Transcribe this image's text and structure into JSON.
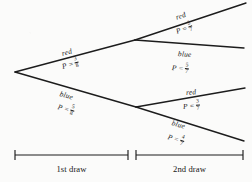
{
  "figure": {
    "type": "probability-tree",
    "background_color": "#fbfbfa",
    "ink_color": "#161616"
  },
  "nodes": {
    "root": {
      "x": 15,
      "y": 72
    },
    "upper": {
      "x": 135,
      "y": 40
    },
    "lower": {
      "x": 136,
      "y": 107
    }
  },
  "branches": [
    {
      "id": "first-red",
      "stage": 1,
      "outcome": "red",
      "probability_text": "P =",
      "numerator": "3",
      "denominator": "8",
      "from": "root",
      "to": "upper",
      "label_x": 62,
      "label_y": 50,
      "prob_x": 62,
      "prob_y": 60,
      "rotation": -15.2
    },
    {
      "id": "first-blue",
      "stage": 1,
      "outcome": "blue",
      "probability_text": "P =",
      "numerator": "5",
      "denominator": "8",
      "from": "root",
      "to": "lower",
      "label_x": 60,
      "label_y": 90,
      "prob_x": 58,
      "prob_y": 100,
      "rotation": 16.0
    },
    {
      "id": "second-upper-red",
      "stage": 2,
      "outcome": "red",
      "probability_text": "P =",
      "numerator": "2",
      "denominator": "7",
      "from": "upper",
      "to": "top-end",
      "label_x": 176,
      "label_y": 14,
      "prob_x": 176,
      "prob_y": 25,
      "rotation": -19.5
    },
    {
      "id": "second-upper-blue",
      "stage": 2,
      "outcome": "blue",
      "probability_text": "P =",
      "numerator": "5",
      "denominator": "7",
      "from": "upper",
      "to": "second-end",
      "label_x": 178,
      "label_y": 50,
      "prob_x": 172,
      "prob_y": 61,
      "rotation": 4.8
    },
    {
      "id": "second-lower-red",
      "stage": 2,
      "outcome": "red",
      "probability_text": "P =",
      "numerator": "3",
      "denominator": "7",
      "from": "lower",
      "to": "third-end",
      "label_x": 186,
      "label_y": 89,
      "prob_x": 183,
      "prob_y": 100,
      "rotation": -5.0
    },
    {
      "id": "second-lower-blue",
      "stage": 2,
      "outcome": "blue",
      "probability_text": "P =",
      "numerator": "4",
      "denominator": "7",
      "from": "lower",
      "to": "bottom-end",
      "label_x": 172,
      "label_y": 119,
      "prob_x": 168,
      "prob_y": 130,
      "rotation": 17.0
    }
  ],
  "endpoints": {
    "top": {
      "x": 246,
      "y": 3
    },
    "second": {
      "x": 244,
      "y": 48
    },
    "third": {
      "x": 245,
      "y": 88
    },
    "bottom": {
      "x": 244,
      "y": 141
    }
  },
  "scale_bars": [
    {
      "id": "first-draw",
      "label": "1st draw",
      "x1": 15,
      "x2": 128,
      "y": 155,
      "label_y": 164
    },
    {
      "id": "second-draw",
      "label": "2nd draw",
      "x1": 136,
      "x2": 243,
      "y": 155,
      "label_y": 164
    }
  ]
}
